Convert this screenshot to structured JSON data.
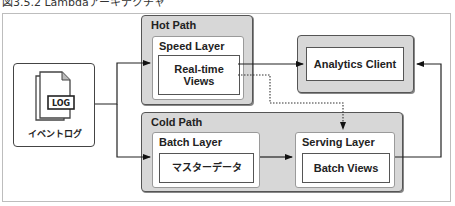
{
  "caption": "図3.5.2 Lambdaアーキテクチャ",
  "source": {
    "label": "イベントログ",
    "icon_text": "LOG",
    "icon": "document-stack-icon"
  },
  "hot_path": {
    "title": "Hot Path",
    "layer": {
      "title": "Speed Layer",
      "view": "Real-time Views"
    }
  },
  "cold_path": {
    "title": "Cold Path",
    "batch_layer": {
      "title": "Batch Layer",
      "content": "マスターデータ"
    },
    "serving_layer": {
      "title": "Serving Layer",
      "content": "Batch Views"
    }
  },
  "client": {
    "label": "Analytics Client"
  },
  "colors": {
    "group_fill": "#d7d7d7",
    "border": "#444444",
    "layer_border": "#9a9a9a",
    "frame_border": "#bdbdbd"
  },
  "edges": [
    {
      "from": "イベントログ",
      "to": "Speed Layer",
      "style": "solid"
    },
    {
      "from": "イベントログ",
      "to": "Batch Layer",
      "style": "solid"
    },
    {
      "from": "Real-time Views",
      "to": "Analytics Client",
      "style": "solid"
    },
    {
      "from": "Real-time Views",
      "to": "Serving Layer",
      "style": "dotted"
    },
    {
      "from": "Batch Layer",
      "to": "Serving Layer",
      "style": "solid"
    },
    {
      "from": "Batch Views",
      "to": "Analytics Client",
      "style": "solid"
    }
  ]
}
